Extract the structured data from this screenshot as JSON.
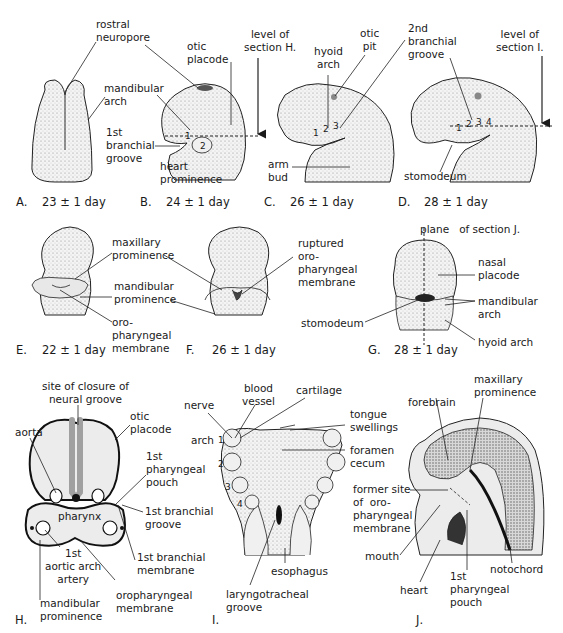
{
  "figure": {
    "panels": {
      "A": {
        "letter": "A.",
        "age": "23 ± 1 day",
        "labels": {
          "rostral_neuropore": "rostral\nneuropore"
        }
      },
      "B": {
        "letter": "B.",
        "age": "24 ± 1 day",
        "labels": {
          "otic_placode": "otic\nplacode",
          "mandibular_arch": "mandibular\narch",
          "first_branchial_groove": "1st\nbranchial\ngroove",
          "heart_prominence": "heart\nprominence",
          "level_of_section": "level of\nsection H."
        },
        "arch_numbers": [
          "1",
          "2"
        ]
      },
      "C": {
        "letter": "C.",
        "age": "26 ± 1 day",
        "labels": {
          "hyoid_arch": "hyoid\narch",
          "otic_pit": "otic\npit",
          "arm_bud": "arm\nbud"
        },
        "arch_numbers": [
          "1",
          "2",
          "3"
        ]
      },
      "D": {
        "letter": "D.",
        "age": "28 ± 1 day",
        "labels": {
          "second_branchial_groove": "2nd\nbranchial\ngroove",
          "level_of_section": "level of\nsection I.",
          "stomodeum": "stomodeum"
        },
        "arch_numbers": [
          "1",
          "2",
          "3",
          "4"
        ]
      },
      "E": {
        "letter": "E.",
        "age": "22 ± 1 day",
        "labels": {
          "maxillary_prominence": "maxillary\nprominence",
          "mandibular_prominence": "mandibular\nprominence",
          "oropharyngeal_membrane": "oro-\npharyngeal\nmembrane"
        }
      },
      "F": {
        "letter": "F.",
        "age": "26 ± 1 day",
        "labels": {
          "ruptured_membrane": "ruptured\noro-\npharyngeal\nmembrane"
        }
      },
      "G": {
        "letter": "G.",
        "age": "28 ± 1 day",
        "labels": {
          "plane_of_section": "plane   of section J.",
          "nasal_placode": "nasal\nplacode",
          "mandibular_arch": "mandibular\narch",
          "stomodeum": "stomodeum",
          "hyoid_arch": "hyoid arch"
        }
      },
      "H": {
        "letter": "H.",
        "labels": {
          "site_of_closure": "site of closure of\nneural groove",
          "aorta": "aorta",
          "otic_placode": "otic\nplacode",
          "first_pharyngeal_pouch": "1st\npharyngeal\npouch",
          "pharynx": "pharynx",
          "first_branchial_groove": "1st branchial\ngroove",
          "first_aortic_arch_artery": "1st\naortic arch\nartery",
          "first_branchial_membrane": "1st branchial\nmembrane",
          "oropharyngeal_membrane": "oropharyngeal\nmembrane",
          "mandibular_prominence": "mandibular\nprominence"
        }
      },
      "I": {
        "letter": "I.",
        "labels": {
          "nerve": "nerve",
          "blood_vessel": "blood\nvessel",
          "cartilage": "cartilage",
          "tongue_swellings": "tongue\nswellings",
          "arch": "arch",
          "foramen_cecum": "foramen\ncecum",
          "esophagus": "esophagus",
          "laryngotracheal_groove": "laryngotracheal\ngroove"
        },
        "arch_numbers": [
          "1",
          "2",
          "3",
          "4"
        ]
      },
      "J": {
        "letter": "J.",
        "labels": {
          "maxillary_prominence": "maxillary\nprominence",
          "forebrain": "forebrain",
          "former_site": "former site\nof  oro-\npharyngeal\nmembrane",
          "mouth": "mouth",
          "notochord": "notochord",
          "heart": "heart",
          "first_pharyngeal_pouch": "1st\npharyngeal\npouch"
        }
      }
    },
    "colors": {
      "ink": "#1a1a1a",
      "tissue_fill": "#ececec",
      "neural_tube": "#a0a0a0",
      "background": "#ffffff"
    }
  }
}
